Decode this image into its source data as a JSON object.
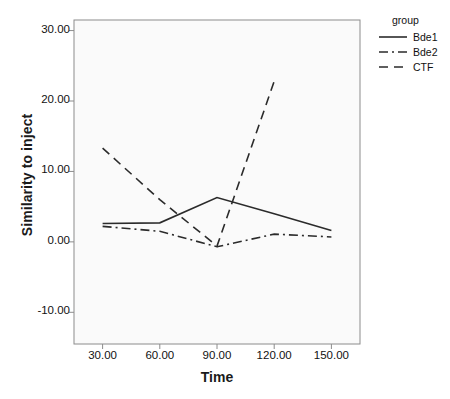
{
  "chart_data": {
    "type": "line",
    "title": "",
    "xlabel": "Time",
    "ylabel": "Similarity to inject",
    "x": [
      30,
      60,
      90,
      120,
      150
    ],
    "xticklabels": [
      "30.00",
      "60.00",
      "90.00",
      "120.00",
      "150.00"
    ],
    "yticks": [
      30,
      20,
      10,
      0,
      -10
    ],
    "yticklabels": [
      "30.00",
      "20.00",
      "10.00",
      "0.00",
      "-10.00"
    ],
    "xlim": [
      15,
      165
    ],
    "ylim": [
      -14.5,
      31.5
    ],
    "grid": false,
    "legend_position": "right",
    "legend_title": "group",
    "series": [
      {
        "name": "Bde1",
        "style": "solid",
        "x": [
          30,
          60,
          90,
          120,
          150
        ],
        "values": [
          2.6,
          2.7,
          6.3,
          4.0,
          1.6
        ]
      },
      {
        "name": "Bde2",
        "style": "dash-dot",
        "x": [
          30,
          60,
          90,
          120,
          150
        ],
        "values": [
          2.2,
          1.5,
          -0.7,
          1.1,
          0.7
        ]
      },
      {
        "name": "CTF",
        "style": "dashed",
        "x": [
          30,
          60,
          90,
          120
        ],
        "values": [
          13.3,
          6.0,
          -0.6,
          22.8
        ]
      }
    ],
    "colors": {
      "line": "#2b2b2b",
      "plot_background": "#fafafa",
      "plot_border": "#8c8c8c",
      "text": "#111111"
    }
  }
}
